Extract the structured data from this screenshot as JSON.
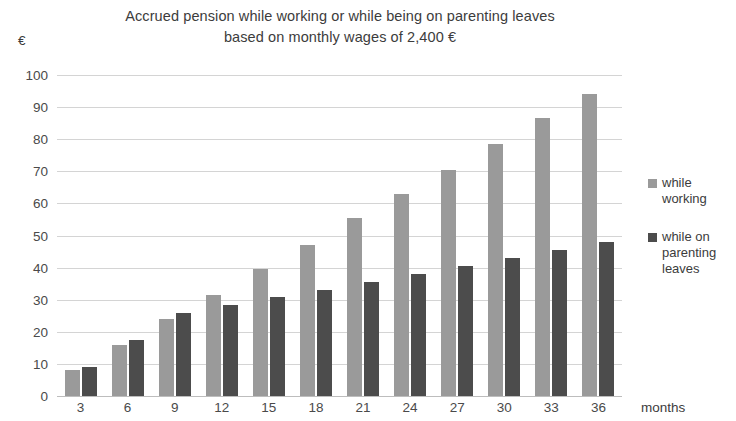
{
  "chart_data": {
    "type": "bar",
    "title": "Accrued pension while working or while being on parenting leaves\nbased on monthly wages of 2,400 €",
    "xlabel": "months",
    "ylabel": "€",
    "ylim": [
      0,
      100
    ],
    "ytick_step": 10,
    "grid": true,
    "legend_position": "right",
    "categories": [
      "3",
      "6",
      "9",
      "12",
      "15",
      "18",
      "21",
      "24",
      "27",
      "30",
      "33",
      "36"
    ],
    "yticks": [
      "100",
      "90",
      "80",
      "70",
      "60",
      "50",
      "40",
      "30",
      "20",
      "10",
      "0"
    ],
    "series": [
      {
        "name": "while working",
        "color": "#9a9a9a",
        "values": [
          8,
          16,
          24,
          31.5,
          39.5,
          47,
          55.5,
          63,
          70.5,
          78.5,
          86.5,
          94
        ]
      },
      {
        "name": "while on parenting leaves",
        "color": "#4c4c4c",
        "values": [
          9,
          17.5,
          26,
          28.5,
          31,
          33,
          35.5,
          38,
          40.5,
          43,
          45.5,
          48
        ]
      }
    ]
  },
  "legend": {
    "items": [
      {
        "label": "while working"
      },
      {
        "label": "while on parenting leaves"
      }
    ]
  }
}
